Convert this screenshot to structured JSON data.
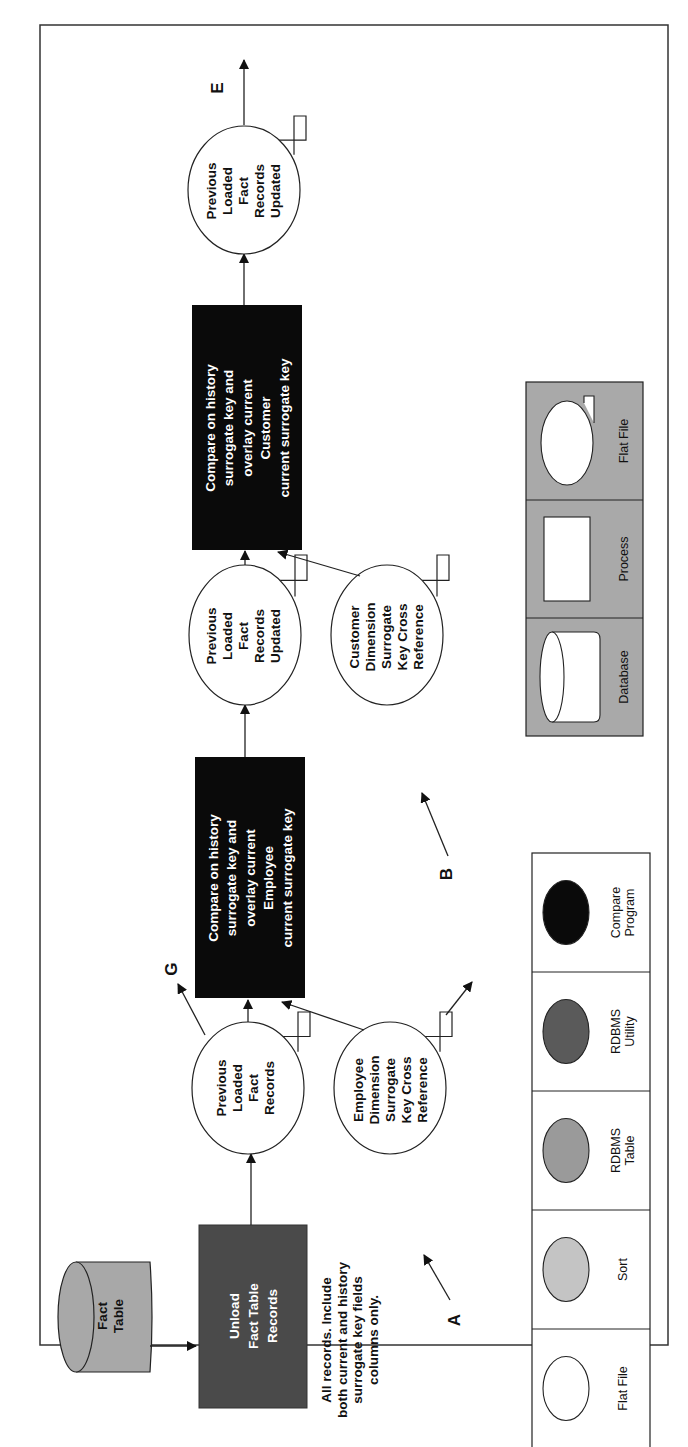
{
  "figure": {
    "orientation": "rotated-90-ccw",
    "border": {
      "x": 40,
      "y": 25,
      "w": 628,
      "h": 1320
    }
  },
  "colors": {
    "database_fill": "#a8a8a8",
    "unload_fill": "#4a4a4a",
    "compare_fill": "#0a0a0a",
    "legend_bg": "#a9a9a9",
    "sort": "#c4c4c4",
    "rdbms_table": "#9a9a9a",
    "rdbms_utility": "#5a5a5a",
    "compare_program": "#0a0a0a",
    "line": "#222222"
  },
  "nodes": {
    "fact_table": {
      "label": [
        "Fact",
        "Table"
      ],
      "type": "database"
    },
    "unload": {
      "label": [
        "Unload",
        "Fact Table",
        "Records"
      ],
      "type": "rdbms-utility"
    },
    "unload_note": {
      "label": [
        "All records. Include",
        "both current and history",
        "surrogate key fields",
        "columns only."
      ]
    },
    "prev_loaded_1": {
      "label": [
        "Previous",
        "Loaded",
        "Fact",
        "Records"
      ],
      "type": "flat-file"
    },
    "emp_xref": {
      "label": [
        "Employee",
        "Dimension",
        "Surrogate",
        "Key Cross",
        "Reference"
      ],
      "type": "flat-file"
    },
    "compare_emp": {
      "label": [
        "Compare on history",
        "surrogate key and",
        "overlay current",
        "Employee",
        "current surrogate key"
      ],
      "type": "compare-program"
    },
    "prev_loaded_2": {
      "label": [
        "Previous",
        "Loaded",
        "Fact",
        "Records",
        "Updated"
      ],
      "type": "flat-file"
    },
    "cust_xref": {
      "label": [
        "Customer",
        "Dimension",
        "Surrogate",
        "Key Cross",
        "Reference"
      ],
      "type": "flat-file"
    },
    "compare_cust": {
      "label": [
        "Compare on history",
        "surrogate key and",
        "overlay current",
        "Customer",
        "current surrogate key"
      ],
      "type": "compare-program"
    },
    "prev_loaded_3": {
      "label": [
        "Previous",
        "Loaded",
        "Fact",
        "Records",
        "Updated"
      ],
      "type": "flat-file"
    }
  },
  "connectors": {
    "A": "A",
    "B": "B",
    "E": "E",
    "G": "G"
  },
  "edges": [
    {
      "from": "fact_table",
      "to": "unload"
    },
    {
      "from": "unload",
      "to": "prev_loaded_1"
    },
    {
      "from": "prev_loaded_1",
      "to": "compare_emp"
    },
    {
      "from": "prev_loaded_1",
      "to": "G"
    },
    {
      "from": "A",
      "to": "emp_xref"
    },
    {
      "from": "emp_xref",
      "to": "compare_emp"
    },
    {
      "from": "emp_xref",
      "to": "off-page"
    },
    {
      "from": "compare_emp",
      "to": "prev_loaded_2"
    },
    {
      "from": "prev_loaded_2",
      "to": "compare_cust"
    },
    {
      "from": "B",
      "to": "cust_xref"
    },
    {
      "from": "cust_xref",
      "to": "compare_cust"
    },
    {
      "from": "compare_cust",
      "to": "prev_loaded_3"
    },
    {
      "from": "prev_loaded_3",
      "to": "E"
    }
  ],
  "legend_shapes": {
    "items": [
      {
        "label": [
          "Flat File"
        ],
        "fill": "#ffffff"
      },
      {
        "label": [
          "Sort"
        ],
        "fill": "#c4c4c4"
      },
      {
        "label": [
          "RDBMS",
          "Table"
        ],
        "fill": "#9a9a9a"
      },
      {
        "label": [
          "RDBMS",
          "Utility"
        ],
        "fill": "#5a5a5a"
      },
      {
        "label": [
          "Compare",
          "Program"
        ],
        "fill": "#0a0a0a"
      }
    ]
  },
  "legend_symbols": {
    "items": [
      {
        "label": "Database",
        "symbol": "cylinder"
      },
      {
        "label": "Process",
        "symbol": "rectangle"
      },
      {
        "label": "Flat File",
        "symbol": "flat-file"
      }
    ]
  }
}
